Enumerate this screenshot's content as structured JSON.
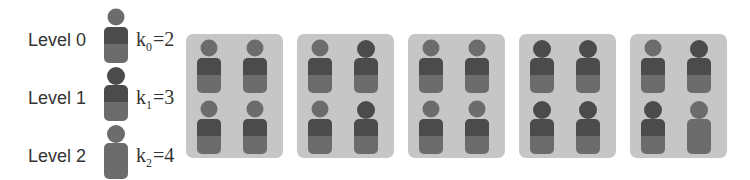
{
  "legend": {
    "levels": [
      {
        "label": "Level 0",
        "k_symbol": "k",
        "k_sub": "0",
        "k_value": "=2",
        "style": "level0"
      },
      {
        "label": "Level 1",
        "k_symbol": "k",
        "k_sub": "1",
        "k_value": "=3",
        "style": "level1"
      },
      {
        "label": "Level 2",
        "k_symbol": "k",
        "k_sub": "2",
        "k_value": "=4",
        "style": "level2"
      }
    ]
  },
  "colors": {
    "box_background": "#c6c6c6",
    "dark": "#4b4b4b",
    "medium": "#6c6c6c",
    "text": "#333333"
  },
  "groups": [
    {
      "members": [
        "level0",
        "level0",
        "level0",
        "level0"
      ]
    },
    {
      "members": [
        "level0",
        "level1",
        "level0",
        "level1"
      ]
    },
    {
      "members": [
        "level0",
        "level0",
        "level0",
        "level0"
      ]
    },
    {
      "members": [
        "level1",
        "level1",
        "level1",
        "level1"
      ]
    },
    {
      "members": [
        "level0",
        "level1",
        "level1",
        "level2"
      ]
    }
  ]
}
